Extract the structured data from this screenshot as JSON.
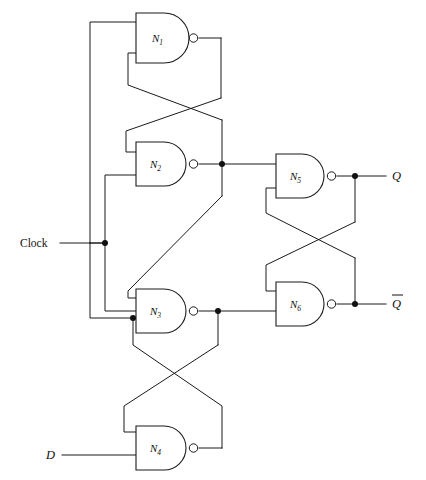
{
  "figure": {
    "type": "logic-circuit-schematic",
    "width": 426,
    "height": 480,
    "background": "#ffffff",
    "line_color": "#1a1a1a"
  },
  "gates": [
    {
      "id": "N1",
      "label": "N",
      "subscript": "1",
      "type": "NAND",
      "x": 136,
      "y": 13,
      "w": 56,
      "h": 50,
      "inputs": 2
    },
    {
      "id": "N2",
      "label": "N",
      "subscript": "2",
      "type": "NAND",
      "x": 136,
      "y": 142,
      "w": 56,
      "h": 44,
      "inputs": 2
    },
    {
      "id": "N3",
      "label": "N",
      "subscript": "3",
      "type": "NAND",
      "x": 136,
      "y": 289,
      "w": 56,
      "h": 44,
      "inputs": 3
    },
    {
      "id": "N4",
      "label": "N",
      "subscript": "4",
      "type": "NAND",
      "x": 136,
      "y": 423,
      "w": 56,
      "h": 44,
      "inputs": 2
    },
    {
      "id": "N5",
      "label": "N",
      "subscript": "5",
      "type": "NAND",
      "x": 276,
      "y": 154,
      "w": 54,
      "h": 44,
      "inputs": 2
    },
    {
      "id": "N6",
      "label": "N",
      "subscript": "6",
      "type": "NAND",
      "x": 276,
      "y": 282,
      "w": 54,
      "h": 44,
      "inputs": 2
    }
  ],
  "io_labels": [
    {
      "id": "clock",
      "text": "Clock",
      "italic": false,
      "overbar": false,
      "x": 20,
      "y": 247
    },
    {
      "id": "data",
      "text": "D",
      "italic": true,
      "overbar": false,
      "x": 46,
      "y": 459
    },
    {
      "id": "q",
      "text": "Q",
      "italic": true,
      "overbar": false,
      "x": 392,
      "y": 177
    },
    {
      "id": "qbar",
      "text": "Q",
      "italic": true,
      "overbar": true,
      "x": 392,
      "y": 305
    }
  ],
  "junction_dots": [
    {
      "id": "clock-tap",
      "x": 105,
      "y": 243
    },
    {
      "id": "n3-lower-input-tap",
      "x": 133,
      "y": 318
    },
    {
      "id": "n2-output-tap",
      "x": 222,
      "y": 164
    },
    {
      "id": "n3-output-tap",
      "x": 218,
      "y": 311
    },
    {
      "id": "q-tap",
      "x": 355,
      "y": 176
    },
    {
      "id": "qbar-tap",
      "x": 355,
      "y": 304
    }
  ],
  "nets": [
    {
      "id": "clock-net",
      "from": "Clock input",
      "to": "N1 top input, N2 lower input, N3 middle input"
    },
    {
      "id": "n1-out-net",
      "from": "N1 output",
      "to": "N2 upper input (cross-coupled)"
    },
    {
      "id": "n2-out-net",
      "from": "N2 output",
      "to": "N1 lower input, N5 upper input, N3 upper input"
    },
    {
      "id": "n3-out-net",
      "from": "N3 output",
      "to": "N4 upper input (cross-coupled), N6 lower input"
    },
    {
      "id": "n4-out-net",
      "from": "N4 output",
      "to": "N3 lower input"
    },
    {
      "id": "n5-out-net",
      "from": "N5 output",
      "to": "Q, N6 upper input"
    },
    {
      "id": "n6-out-net",
      "from": "N6 output",
      "to": "Q-bar, N5 lower input"
    },
    {
      "id": "d-net",
      "from": "D input",
      "to": "N4 lower input"
    }
  ]
}
